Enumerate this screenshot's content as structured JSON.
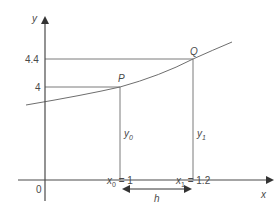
{
  "diagram": {
    "axes": {
      "x_label": "x",
      "y_label": "y",
      "origin_label": "0"
    },
    "y_ticks": [
      {
        "label": "4.4",
        "value": 4.4
      },
      {
        "label": "4",
        "value": 4
      }
    ],
    "points": {
      "P": {
        "label": "P",
        "x": 1,
        "y": 4
      },
      "Q": {
        "label": "Q",
        "x": 1.2,
        "y": 4.4
      }
    },
    "ordinates": {
      "y0": {
        "base": "y",
        "sub": "0"
      },
      "y1": {
        "base": "y",
        "sub": "1"
      }
    },
    "x_marks": {
      "x0": {
        "base": "x",
        "sub": "0",
        "rest": " = 1"
      },
      "x1": {
        "base": "x",
        "sub": "1",
        "rest": " = 1.2"
      }
    },
    "step": {
      "label": "h"
    },
    "colors": {
      "line": "#6e6e6e",
      "axis": "#4a4a4a",
      "text": "#4a4a4a"
    }
  }
}
